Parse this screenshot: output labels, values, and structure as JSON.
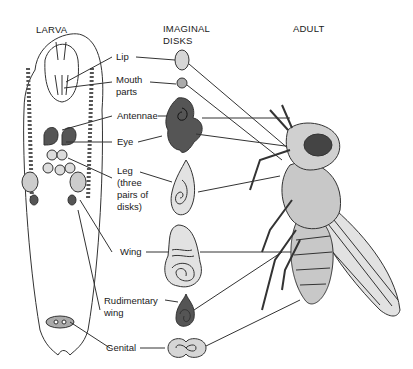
{
  "headers": {
    "larva": "LARVA",
    "disks_line1": "IMAGINAL",
    "disks_line2": "DISKS",
    "adult": "ADULT"
  },
  "labels": {
    "lip": "Lip",
    "mouth_1": "Mouth",
    "mouth_2": "parts",
    "antennae": "Antennae",
    "eye": "Eye",
    "leg_1": "Leg",
    "leg_2": "(three",
    "leg_3": "pairs of",
    "leg_4": "disks)",
    "wing": "Wing",
    "rud_1": "Rudimentary",
    "rud_2": "wing",
    "genital": "Genital"
  },
  "colors": {
    "line": "#333333",
    "light_disk": "#d6d6d6",
    "dark_disk": "#555555",
    "wing_fill": "#e2e2e2",
    "body_fill": "#c8c8c8"
  }
}
